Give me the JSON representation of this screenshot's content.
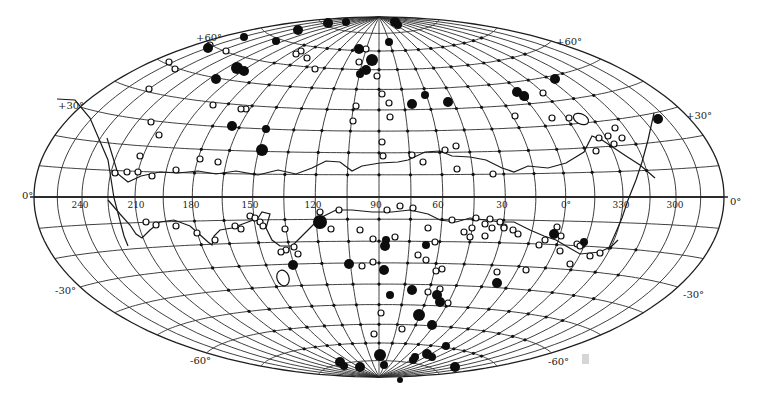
{
  "map": {
    "projection": "Aitoff equal-area (galactic coordinates)",
    "center_longitude": 90,
    "frame": {
      "cx": 379,
      "cy": 197,
      "rx": 345,
      "ry": 180
    },
    "colors": {
      "ink": "#111111",
      "grid": "#2a2a2a",
      "paper": "#ffffff"
    },
    "latitude_labels": [
      {
        "id": "lat-plus60-left",
        "text": "+60°",
        "x": 196,
        "y": 41
      },
      {
        "id": "lat-plus60-right",
        "text": "+60°",
        "x": 556,
        "y": 45
      },
      {
        "id": "lat-plus30-left",
        "text": "+30°",
        "x": 58,
        "y": 109
      },
      {
        "id": "lat-plus30-right",
        "text": "+30°",
        "x": 686,
        "y": 119
      },
      {
        "id": "lat-zero-left",
        "text": "0°",
        "x": 22,
        "y": 199
      },
      {
        "id": "lat-zero-right",
        "text": "0°",
        "x": 730,
        "y": 205
      },
      {
        "id": "lat-minus30-left",
        "text": "-30°",
        "x": 55,
        "y": 294
      },
      {
        "id": "lat-minus30-right",
        "text": "-30°",
        "x": 683,
        "y": 298
      },
      {
        "id": "lat-minus60-left",
        "text": "-60°",
        "x": 190,
        "y": 364
      },
      {
        "id": "lat-minus60-right",
        "text": "-60°",
        "x": 548,
        "y": 365
      }
    ],
    "longitude_labels": [
      {
        "text": "240",
        "x": 80,
        "y": 208
      },
      {
        "text": "210",
        "x": 136,
        "y": 208
      },
      {
        "text": "180",
        "x": 191,
        "y": 208
      },
      {
        "text": "150",
        "x": 250,
        "y": 208
      },
      {
        "text": "120",
        "x": 313,
        "y": 208
      },
      {
        "text": "90",
        "x": 376,
        "y": 208
      },
      {
        "text": "60",
        "x": 438,
        "y": 208
      },
      {
        "text": "30",
        "x": 502,
        "y": 208
      },
      {
        "text": "0°",
        "x": 566,
        "y": 208
      },
      {
        "text": "330",
        "x": 621,
        "y": 208
      },
      {
        "text": "300",
        "x": 675,
        "y": 208
      }
    ],
    "legend_symbols": {
      "small_dot": "grid sample point",
      "open_circle": "open-circle object",
      "filled_circle": "filled-circle object"
    },
    "boundary_north": [
      [
        107,
        138
      ],
      [
        118,
        174
      ],
      [
        128,
        182
      ],
      [
        141,
        176
      ],
      [
        160,
        172
      ],
      [
        178,
        173
      ],
      [
        198,
        171
      ],
      [
        216,
        174
      ],
      [
        236,
        171
      ],
      [
        258,
        175
      ],
      [
        278,
        170
      ],
      [
        296,
        174
      ],
      [
        312,
        168
      ],
      [
        326,
        161
      ],
      [
        340,
        162
      ],
      [
        352,
        171
      ],
      [
        362,
        166
      ],
      [
        380,
        163
      ],
      [
        398,
        162
      ],
      [
        408,
        160
      ],
      [
        425,
        152
      ],
      [
        440,
        151
      ],
      [
        452,
        156
      ],
      [
        470,
        157
      ],
      [
        486,
        160
      ],
      [
        502,
        168
      ],
      [
        514,
        172
      ],
      [
        528,
        166
      ],
      [
        548,
        168
      ],
      [
        566,
        163
      ],
      [
        584,
        152
      ],
      [
        592,
        136
      ],
      [
        602,
        140
      ],
      [
        614,
        148
      ],
      [
        626,
        156
      ],
      [
        640,
        165
      ],
      [
        655,
        178
      ]
    ],
    "boundary_south": [
      [
        108,
        200
      ],
      [
        120,
        214
      ],
      [
        130,
        225
      ],
      [
        136,
        234
      ],
      [
        142,
        238
      ],
      [
        150,
        230
      ],
      [
        160,
        222
      ],
      [
        174,
        220
      ],
      [
        190,
        226
      ],
      [
        198,
        233
      ],
      [
        208,
        242
      ],
      [
        212,
        245
      ],
      [
        214,
        236
      ],
      [
        220,
        230
      ],
      [
        232,
        228
      ],
      [
        248,
        222
      ],
      [
        258,
        218
      ],
      [
        262,
        212
      ],
      [
        270,
        214
      ],
      [
        266,
        228
      ],
      [
        272,
        240
      ],
      [
        280,
        246
      ],
      [
        292,
        246
      ],
      [
        300,
        238
      ],
      [
        306,
        232
      ],
      [
        320,
        218
      ],
      [
        336,
        210
      ],
      [
        352,
        210
      ],
      [
        372,
        212
      ],
      [
        392,
        212
      ],
      [
        410,
        210
      ],
      [
        428,
        214
      ],
      [
        440,
        220
      ],
      [
        456,
        222
      ],
      [
        470,
        218
      ],
      [
        486,
        220
      ],
      [
        500,
        222
      ],
      [
        514,
        222
      ],
      [
        530,
        230
      ],
      [
        544,
        236
      ],
      [
        556,
        240
      ],
      [
        566,
        246
      ],
      [
        580,
        254
      ],
      [
        600,
        252
      ],
      [
        612,
        246
      ],
      [
        618,
        240
      ]
    ],
    "cross_line": [
      [
        57,
        99
      ],
      [
        75,
        100
      ],
      [
        90,
        118
      ],
      [
        108,
        160
      ],
      [
        114,
        198
      ],
      [
        124,
        236
      ],
      [
        128,
        246
      ]
    ],
    "cross_line_right": [
      [
        654,
        113
      ],
      [
        648,
        140
      ],
      [
        642,
        162
      ],
      [
        636,
        180
      ],
      [
        628,
        200
      ],
      [
        622,
        218
      ],
      [
        616,
        232
      ],
      [
        608,
        250
      ]
    ],
    "filled": [
      [
        208,
        48,
        5
      ],
      [
        244,
        37,
        4
      ],
      [
        276,
        41,
        4
      ],
      [
        298,
        30,
        5
      ],
      [
        328,
        23,
        5
      ],
      [
        346,
        22,
        4
      ],
      [
        395,
        22,
        5
      ],
      [
        398,
        25,
        4
      ],
      [
        359,
        49,
        5
      ],
      [
        389,
        42,
        4
      ],
      [
        372,
        60,
        6
      ],
      [
        366,
        70,
        5
      ],
      [
        360,
        74,
        4
      ],
      [
        216,
        79,
        5
      ],
      [
        237,
        68,
        6
      ],
      [
        244,
        71,
        5
      ],
      [
        266,
        129,
        4
      ],
      [
        262,
        150,
        6
      ],
      [
        232,
        126,
        5
      ],
      [
        555,
        79,
        5
      ],
      [
        524,
        96,
        5
      ],
      [
        525,
        97,
        4
      ],
      [
        517,
        92,
        5
      ],
      [
        658,
        119,
        5
      ],
      [
        425,
        95,
        4
      ],
      [
        448,
        102,
        5
      ],
      [
        412,
        104,
        5
      ],
      [
        385,
        246,
        5
      ],
      [
        386,
        240,
        4
      ],
      [
        320,
        222,
        7
      ],
      [
        426,
        245,
        4
      ],
      [
        349,
        264,
        5
      ],
      [
        384,
        270,
        5
      ],
      [
        390,
        295,
        4
      ],
      [
        437,
        295,
        5
      ],
      [
        440,
        302,
        5
      ],
      [
        412,
        290,
        5
      ],
      [
        419,
        315,
        6
      ],
      [
        432,
        325,
        5
      ],
      [
        455,
        367,
        5
      ],
      [
        432,
        357,
        4
      ],
      [
        446,
        346,
        4
      ],
      [
        380,
        355,
        6
      ],
      [
        360,
        367,
        5
      ],
      [
        340,
        362,
        5
      ],
      [
        344,
        366,
        4
      ],
      [
        384,
        365,
        4
      ],
      [
        413,
        360,
        4
      ],
      [
        293,
        265,
        5
      ],
      [
        497,
        283,
        5
      ],
      [
        554,
        234,
        5
      ],
      [
        584,
        242,
        4
      ],
      [
        427,
        354,
        5
      ],
      [
        415,
        357,
        4
      ],
      [
        400,
        380,
        3
      ]
    ],
    "open": [
      [
        210,
        45,
        3
      ],
      [
        226,
        51,
        3
      ],
      [
        169,
        62,
        3
      ],
      [
        175,
        69,
        3
      ],
      [
        149,
        89,
        3
      ],
      [
        151,
        122,
        3
      ],
      [
        159,
        135,
        3
      ],
      [
        115,
        173,
        3
      ],
      [
        140,
        156,
        3
      ],
      [
        138,
        172,
        3
      ],
      [
        127,
        172,
        3
      ],
      [
        152,
        176,
        3
      ],
      [
        176,
        170,
        3
      ],
      [
        200,
        159,
        3
      ],
      [
        218,
        162,
        3
      ],
      [
        246,
        109,
        3
      ],
      [
        213,
        105,
        3
      ],
      [
        241,
        109,
        3
      ],
      [
        307,
        58,
        3
      ],
      [
        301,
        51,
        3
      ],
      [
        296,
        54,
        3
      ],
      [
        315,
        69,
        3
      ],
      [
        366,
        49,
        3
      ],
      [
        359,
        62,
        3
      ],
      [
        356,
        106,
        3
      ],
      [
        353,
        121,
        3
      ],
      [
        377,
        76,
        3
      ],
      [
        382,
        94,
        3
      ],
      [
        390,
        117,
        3
      ],
      [
        389,
        103,
        3
      ],
      [
        382,
        142,
        3
      ],
      [
        383,
        156,
        3
      ],
      [
        412,
        155,
        3
      ],
      [
        423,
        162,
        3
      ],
      [
        445,
        150,
        3
      ],
      [
        456,
        146,
        3
      ],
      [
        457,
        169,
        3
      ],
      [
        493,
        174,
        3
      ],
      [
        515,
        116,
        3
      ],
      [
        543,
        93,
        3
      ],
      [
        552,
        118,
        3
      ],
      [
        569,
        118,
        3
      ],
      [
        596,
        151,
        3
      ],
      [
        608,
        136,
        3
      ],
      [
        615,
        128,
        3
      ],
      [
        599,
        138,
        3
      ],
      [
        622,
        138,
        3
      ],
      [
        614,
        144,
        3
      ],
      [
        413,
        208,
        3
      ],
      [
        428,
        228,
        3
      ],
      [
        452,
        220,
        3
      ],
      [
        472,
        228,
        3
      ],
      [
        492,
        228,
        3
      ],
      [
        518,
        234,
        3
      ],
      [
        504,
        227,
        3
      ],
      [
        476,
        218,
        3
      ],
      [
        490,
        219,
        3
      ],
      [
        500,
        222,
        3
      ],
      [
        504,
        228,
        3
      ],
      [
        485,
        224,
        3
      ],
      [
        513,
        230,
        3
      ],
      [
        539,
        245,
        3
      ],
      [
        545,
        240,
        3
      ],
      [
        526,
        270,
        3
      ],
      [
        570,
        264,
        3
      ],
      [
        590,
        256,
        3
      ],
      [
        560,
        251,
        3
      ],
      [
        577,
        244,
        3
      ],
      [
        561,
        236,
        3
      ],
      [
        557,
        227,
        3
      ],
      [
        580,
        246,
        3
      ],
      [
        600,
        253,
        3
      ],
      [
        436,
        271,
        3
      ],
      [
        442,
        269,
        3
      ],
      [
        440,
        289,
        3
      ],
      [
        428,
        292,
        3
      ],
      [
        497,
        272,
        3
      ],
      [
        402,
        329,
        3
      ],
      [
        374,
        334,
        3
      ],
      [
        448,
        303,
        3
      ],
      [
        485,
        236,
        3
      ],
      [
        470,
        237,
        3
      ],
      [
        400,
        206,
        3
      ],
      [
        146,
        222,
        3
      ],
      [
        156,
        225,
        3
      ],
      [
        176,
        226,
        3
      ],
      [
        197,
        233,
        3
      ],
      [
        215,
        240,
        3
      ],
      [
        235,
        226,
        3
      ],
      [
        241,
        229,
        3
      ],
      [
        250,
        216,
        3
      ],
      [
        255,
        218,
        3
      ],
      [
        260,
        222,
        3
      ],
      [
        263,
        226,
        3
      ],
      [
        286,
        250,
        3
      ],
      [
        294,
        247,
        3
      ],
      [
        298,
        254,
        3
      ],
      [
        285,
        229,
        3
      ],
      [
        281,
        252,
        3
      ],
      [
        320,
        212,
        3
      ],
      [
        319,
        225,
        3
      ],
      [
        331,
        229,
        3
      ],
      [
        339,
        210,
        3
      ],
      [
        360,
        230,
        3
      ],
      [
        373,
        239,
        3
      ],
      [
        362,
        266,
        3
      ],
      [
        373,
        262,
        3
      ],
      [
        381,
        313,
        3
      ],
      [
        426,
        260,
        3
      ],
      [
        387,
        210,
        3
      ],
      [
        418,
        255,
        3
      ],
      [
        464,
        232,
        3
      ],
      [
        435,
        242,
        3
      ],
      [
        395,
        237,
        3
      ]
    ],
    "ellipse_features": [
      {
        "cx": 581,
        "cy": 119,
        "rx": 8,
        "ry": 5,
        "rot": 25
      },
      {
        "cx": 283,
        "cy": 278,
        "rx": 6,
        "ry": 8,
        "rot": -20
      }
    ],
    "stray_mark": {
      "x": 582,
      "y": 354,
      "w": 7,
      "h": 10
    }
  }
}
